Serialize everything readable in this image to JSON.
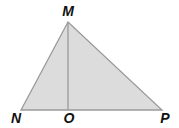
{
  "diagram": {
    "type": "triangle-with-altitude",
    "colors": {
      "fill": "#dcdcdc",
      "stroke": "#9a9a9a",
      "label": "#111111",
      "background": "#ffffff"
    },
    "vertices": {
      "M": {
        "label": "M",
        "x": 68,
        "y": 22
      },
      "N": {
        "label": "N",
        "x": 21,
        "y": 110
      },
      "P": {
        "label": "P",
        "x": 162,
        "y": 110
      },
      "O": {
        "label": "O",
        "x": 68,
        "y": 110
      }
    },
    "segments": [
      {
        "from": "M",
        "to": "N"
      },
      {
        "from": "M",
        "to": "P"
      },
      {
        "from": "N",
        "to": "P"
      },
      {
        "from": "M",
        "to": "O",
        "role": "altitude"
      }
    ]
  }
}
